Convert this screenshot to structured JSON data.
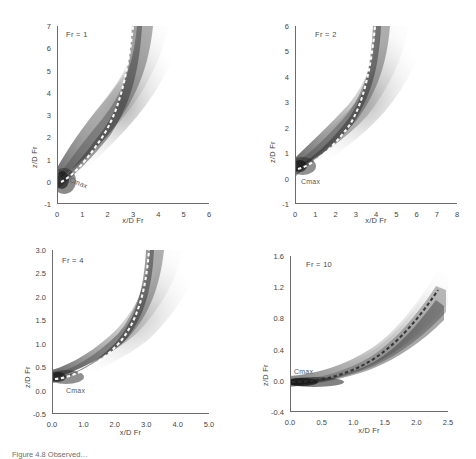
{
  "figure": {
    "caption": "Figure 4.8  Observed…",
    "axis_titles": {
      "x": "x/D Fr",
      "y": "z/D Fr"
    },
    "trajectory_label": "Cmax"
  },
  "chart_data": [
    {
      "type": "heatmap",
      "title": "Fr = 1",
      "xlabel": "x/D Fr",
      "ylabel": "z/D Fr",
      "xlim": [
        0,
        6
      ],
      "ylim": [
        -1,
        7
      ],
      "xticks": [
        "0",
        "1",
        "2",
        "3",
        "4",
        "5",
        "6"
      ],
      "yticks": [
        "-1",
        "0",
        "1",
        "2",
        "3",
        "4",
        "5",
        "6",
        "7"
      ],
      "grid": false,
      "legend": "none",
      "annotations": [
        "Fr = 1",
        "Cmax"
      ],
      "series": [
        {
          "name": "Cmax",
          "style": "white-dashed",
          "x": [
            0.15,
            0.4,
            0.7,
            1.0,
            1.3,
            1.6,
            1.9,
            2.2,
            2.5,
            2.8,
            3.05,
            3.25,
            3.4,
            3.5,
            3.58,
            3.63
          ],
          "y": [
            0.0,
            0.05,
            0.2,
            0.45,
            0.8,
            1.25,
            1.8,
            2.4,
            3.1,
            3.9,
            4.7,
            5.4,
            6.0,
            6.5,
            6.8,
            7.0
          ]
        }
      ]
    },
    {
      "type": "heatmap",
      "title": "Fr = 2",
      "xlabel": "x/D Fr",
      "ylabel": "z/D Fr",
      "xlim": [
        0,
        8
      ],
      "ylim": [
        -1,
        6
      ],
      "xticks": [
        "0",
        "1",
        "2",
        "3",
        "4",
        "5",
        "6",
        "7",
        "8"
      ],
      "yticks": [
        "-1",
        "0",
        "1",
        "2",
        "3",
        "4",
        "5",
        "6"
      ],
      "grid": false,
      "legend": "none",
      "annotations": [
        "Fr = 2",
        "Cmax"
      ],
      "series": [
        {
          "name": "Cmax",
          "style": "white-dashed",
          "x": [
            0.1,
            0.5,
            0.9,
            1.3,
            1.7,
            2.1,
            2.5,
            2.9,
            3.2,
            3.5,
            3.75,
            3.95,
            4.1,
            4.2
          ],
          "y": [
            0.05,
            0.1,
            0.25,
            0.5,
            0.85,
            1.3,
            1.85,
            2.5,
            3.1,
            3.8,
            4.4,
            5.0,
            5.5,
            6.0
          ]
        }
      ]
    },
    {
      "type": "heatmap",
      "title": "Fr = 4",
      "xlabel": "x/D Fr",
      "ylabel": "z/D Fr",
      "xlim": [
        0.0,
        5.0
      ],
      "ylim": [
        -0.5,
        3.0
      ],
      "xticks": [
        "0.0",
        "1.0",
        "2.0",
        "3.0",
        "4.0",
        "5.0"
      ],
      "yticks": [
        "-0.5",
        "0.0",
        "0.5",
        "1.0",
        "1.5",
        "2.0",
        "2.5",
        "3.0"
      ],
      "grid": false,
      "legend": "none",
      "annotations": [
        "Fr = 4",
        "Cmax"
      ],
      "series": [
        {
          "name": "Cmax",
          "style": "white-dashed",
          "x": [
            0.05,
            0.4,
            0.8,
            1.2,
            1.6,
            2.0,
            2.4,
            2.75,
            3.05,
            3.3,
            3.5,
            3.68,
            3.8
          ],
          "y": [
            0.02,
            0.05,
            0.12,
            0.25,
            0.42,
            0.65,
            0.95,
            1.3,
            1.7,
            2.1,
            2.45,
            2.75,
            3.0
          ]
        }
      ]
    },
    {
      "type": "heatmap",
      "title": "Fr = 10",
      "xlabel": "x/D Fr",
      "ylabel": "z/D Fr",
      "xlim": [
        0.0,
        2.5
      ],
      "ylim": [
        -0.4,
        1.6
      ],
      "xticks": [
        "0.0",
        "0.5",
        "1.0",
        "1.5",
        "2.0",
        "2.5"
      ],
      "yticks": [
        "-0.4",
        "0.0",
        "0.4",
        "0.8",
        "1.2",
        "1.6"
      ],
      "grid": false,
      "legend": "none",
      "annotations": [
        "Fr = 10",
        "Cmax"
      ],
      "series": [
        {
          "name": "Cmax",
          "style": "dark-dashed",
          "x": [
            0.05,
            0.3,
            0.55,
            0.8,
            1.0,
            1.2,
            1.4,
            1.6,
            1.8,
            2.0,
            2.2,
            2.4
          ],
          "y": [
            0.0,
            0.0,
            0.01,
            0.04,
            0.08,
            0.14,
            0.22,
            0.32,
            0.44,
            0.58,
            0.72,
            0.84
          ]
        }
      ]
    }
  ]
}
